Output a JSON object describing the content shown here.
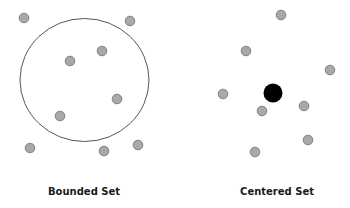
{
  "colors": {
    "background": "#ffffff",
    "dot_fill": "#a9a9a9",
    "dot_stroke": "#777777",
    "center_fill": "#000000",
    "boundary_stroke": "#555555",
    "label": "#1a1a1a"
  },
  "diagrams": [
    {
      "name": "bounded-set",
      "label": "Bounded Set",
      "boundary": {
        "cx": 84.5,
        "cy": 80,
        "rx": 64.5,
        "ry": 61.5
      },
      "dots": [
        {
          "x": 24,
          "y": 18
        },
        {
          "x": 130,
          "y": 21
        },
        {
          "x": 102,
          "y": 51
        },
        {
          "x": 70,
          "y": 61
        },
        {
          "x": 117,
          "y": 99
        },
        {
          "x": 60,
          "y": 116
        },
        {
          "x": 30,
          "y": 148
        },
        {
          "x": 104,
          "y": 151
        },
        {
          "x": 138,
          "y": 145
        }
      ],
      "label_pos": {
        "x": 84,
        "y": 186
      }
    },
    {
      "name": "centered-set",
      "label": "Centered Set",
      "center": {
        "x": 273,
        "y": 93,
        "r": 9.5
      },
      "dots": [
        {
          "x": 281,
          "y": 15
        },
        {
          "x": 246,
          "y": 51
        },
        {
          "x": 330,
          "y": 70
        },
        {
          "x": 223,
          "y": 94
        },
        {
          "x": 262,
          "y": 111
        },
        {
          "x": 304,
          "y": 106
        },
        {
          "x": 308,
          "y": 140
        },
        {
          "x": 255,
          "y": 152
        }
      ],
      "label_pos": {
        "x": 277,
        "y": 186
      }
    }
  ]
}
